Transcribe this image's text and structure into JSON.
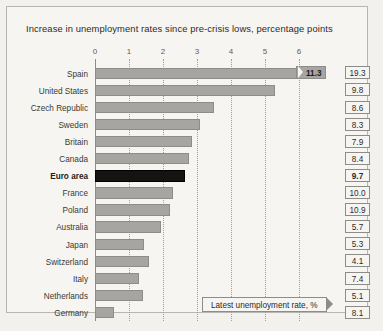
{
  "chart_title": "Increase in unemployment rates since pre-crisis lows, percentage points",
  "callout": {
    "label": "Latest unemployment rate, %"
  },
  "axis": {
    "ticks": [
      "0",
      "1",
      "2",
      "3",
      "4",
      "5",
      "6"
    ]
  },
  "chart_data": {
    "type": "bar",
    "title": "Increase in unemployment rates since pre-crisis lows, percentage points",
    "orientation": "horizontal",
    "xlabel": "percentage points",
    "ylabel": "",
    "xlim": [
      0,
      6
    ],
    "grid": true,
    "legend": "none",
    "annotations": [
      "Latest unemployment rate, %"
    ],
    "categories": [
      "Spain",
      "United States",
      "Czech Republic",
      "Sweden",
      "Britain",
      "Canada",
      "Euro area",
      "France",
      "Poland",
      "Australia",
      "Japan",
      "Switzerland",
      "Italy",
      "Netherlands",
      "Germany"
    ],
    "series": [
      {
        "name": "Increase in unemployment rate since pre-crisis low (pp)",
        "values": [
          11.3,
          5.3,
          3.5,
          3.1,
          2.85,
          2.75,
          2.65,
          2.3,
          2.2,
          1.95,
          1.45,
          1.6,
          1.3,
          1.4,
          0.55
        ]
      },
      {
        "name": "Latest unemployment rate, %",
        "values": [
          19.3,
          9.8,
          8.6,
          8.3,
          7.9,
          8.4,
          9.7,
          10.0,
          10.9,
          5.7,
          5.3,
          4.1,
          7.4,
          5.1,
          8.1
        ]
      }
    ]
  },
  "rows": [
    {
      "label": "Spain",
      "bar": 6.0,
      "broken": true,
      "break_label": "11.3",
      "rate": "19.3",
      "highlight": false
    },
    {
      "label": "United States",
      "bar": 5.3,
      "broken": false,
      "break_label": "",
      "rate": "9.8",
      "highlight": false
    },
    {
      "label": "Czech Republic",
      "bar": 3.5,
      "broken": false,
      "break_label": "",
      "rate": "8.6",
      "highlight": false
    },
    {
      "label": "Sweden",
      "bar": 3.1,
      "broken": false,
      "break_label": "",
      "rate": "8.3",
      "highlight": false
    },
    {
      "label": "Britain",
      "bar": 2.85,
      "broken": false,
      "break_label": "",
      "rate": "7.9",
      "highlight": false
    },
    {
      "label": "Canada",
      "bar": 2.75,
      "broken": false,
      "break_label": "",
      "rate": "8.4",
      "highlight": false
    },
    {
      "label": "Euro area",
      "bar": 2.65,
      "broken": false,
      "break_label": "",
      "rate": "9.7",
      "highlight": true
    },
    {
      "label": "France",
      "bar": 2.3,
      "broken": false,
      "break_label": "",
      "rate": "10.0",
      "highlight": false
    },
    {
      "label": "Poland",
      "bar": 2.2,
      "broken": false,
      "break_label": "",
      "rate": "10.9",
      "highlight": false
    },
    {
      "label": "Australia",
      "bar": 1.95,
      "broken": false,
      "break_label": "",
      "rate": "5.7",
      "highlight": false
    },
    {
      "label": "Japan",
      "bar": 1.45,
      "broken": false,
      "break_label": "",
      "rate": "5.3",
      "highlight": false
    },
    {
      "label": "Switzerland",
      "bar": 1.6,
      "broken": false,
      "break_label": "",
      "rate": "4.1",
      "highlight": false
    },
    {
      "label": "Italy",
      "bar": 1.3,
      "broken": false,
      "break_label": "",
      "rate": "7.4",
      "highlight": false
    },
    {
      "label": "Netherlands",
      "bar": 1.4,
      "broken": false,
      "break_label": "",
      "rate": "5.1",
      "highlight": false
    },
    {
      "label": "Germany",
      "bar": 0.55,
      "broken": false,
      "break_label": "",
      "rate": "8.1",
      "highlight": false
    }
  ],
  "colors": {
    "bar": "#a6a5a1",
    "bar_highlight": "#151412",
    "background": "#f6f5f2",
    "frame": "#b7b6b2",
    "text": "#2b2b2b"
  }
}
